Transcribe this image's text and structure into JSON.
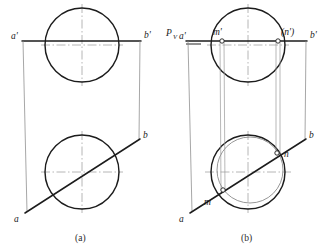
{
  "figure": {
    "kind": "engineering-drawing",
    "background_color": "#ffffff",
    "line_color": "#1c1c1c",
    "thin_line_color": "#8a8a8a",
    "center_line_color": "#9e9e9e",
    "width": 328,
    "height": 250
  },
  "captions": {
    "panel_a": "(a)",
    "panel_b": "(b)"
  },
  "panel_a": {
    "labels": {
      "a_prime": "a'",
      "b_prime": "b'",
      "a": "a",
      "b": "b"
    },
    "geometry": {
      "top_circle": {
        "cx": 82,
        "cy": 45,
        "r": 37
      },
      "bottom_circle": {
        "cx": 82,
        "cy": 172,
        "r": 37
      },
      "front_line": {
        "x1": 22,
        "y1": 41,
        "x2": 141,
        "y2": 41
      },
      "left_vertical": {
        "x1": 23,
        "y1": 41,
        "x2": 27,
        "y2": 212
      },
      "right_vertical": {
        "x1": 140,
        "y1": 41,
        "x2": 139,
        "y2": 140
      },
      "top_line": {
        "x1": 22,
        "y1": 41,
        "x2": 141,
        "y2": 41
      },
      "oblique_line": {
        "x1": 25,
        "y1": 213,
        "x2": 140,
        "y2": 139
      }
    }
  },
  "panel_b": {
    "labels": {
      "pv": "P",
      "pv_subscript": "V",
      "a_prime": "a'",
      "b_prime": "b'",
      "m_prime": "m'",
      "n_prime": "(n')",
      "a": "a",
      "b": "b",
      "m": "m",
      "n": "n"
    },
    "geometry": {
      "top_circle": {
        "cx": 248,
        "cy": 45,
        "r": 37
      },
      "bottom_circle": {
        "cx": 248,
        "cy": 172,
        "r": 37
      },
      "bottom_inner_circle": {
        "cx": 250,
        "cy": 170,
        "r": 33
      },
      "front_line": {
        "x1": 186,
        "y1": 41,
        "x2": 307,
        "y2": 41
      },
      "left_vertical": {
        "x1": 188,
        "y1": 41,
        "x2": 192,
        "y2": 212
      },
      "right_vertical": {
        "x1": 306,
        "y1": 41,
        "x2": 305,
        "y2": 140
      },
      "oblique_line": {
        "x1": 190,
        "y1": 213,
        "x2": 306,
        "y2": 139
      },
      "m_prime_point": {
        "x": 222,
        "y": 41
      },
      "n_prime_point": {
        "x": 278,
        "y": 41
      },
      "m_point": {
        "x": 223,
        "y": 190
      },
      "n_point": {
        "x": 277,
        "y": 153
      },
      "projector_m": {
        "x": 222,
        "y1": 41,
        "y2": 190
      },
      "projector_n": {
        "x": 278,
        "y1": 41,
        "y2": 153
      },
      "pv_tick": {
        "x1": 186,
        "y1": 44,
        "x2": 200,
        "y2": 44
      }
    }
  }
}
